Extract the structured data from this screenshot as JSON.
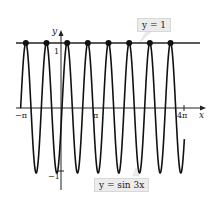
{
  "chart_data": {
    "type": "line",
    "title": "",
    "xlabel": "x",
    "ylabel": "y",
    "series": [
      {
        "name": "y = sin 3x",
        "function": "sin(3x)",
        "x_range": [
          -4.19,
          12.4
        ]
      },
      {
        "name": "y = 1",
        "function": "1",
        "x_range": [
          -4.4,
          14.0
        ]
      }
    ],
    "intersection_points": [
      {
        "x": "-7π/6",
        "y": 1
      },
      {
        "x": "-π/2",
        "y": 1
      },
      {
        "x": "π/6",
        "y": 1
      },
      {
        "x": "5π/6",
        "y": 1
      },
      {
        "x": "3π/2",
        "y": 1
      },
      {
        "x": "13π/6",
        "y": 1
      },
      {
        "x": "17π/6",
        "y": 1
      },
      {
        "x": "7π/2",
        "y": 1
      }
    ],
    "x_ticks": [
      "-π",
      "π",
      "4π"
    ],
    "y_ticks": [
      "1",
      "-1"
    ],
    "annotations": [
      "y = 1",
      "y = sin 3x"
    ],
    "grid": false
  },
  "labels": {
    "x_axis": "x",
    "y_axis": "y",
    "tick_neg_pi": "−π",
    "tick_pi": "π",
    "tick_4pi": "4π",
    "tick_one": "1",
    "tick_neg_one": "−1",
    "callout_line": "y = 1",
    "callout_curve": "y = sin 3x"
  }
}
